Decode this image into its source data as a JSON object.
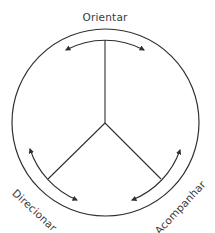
{
  "diagram": {
    "type": "circular-cycle",
    "labels": {
      "top": "Orientar",
      "bottom_left": "Direcionar",
      "bottom_right": "Acompanhar"
    },
    "colors": {
      "stroke": "#2f2f2f",
      "text": "#3a3a3a",
      "background": "#ffffff"
    },
    "sectors": 3,
    "arrows": [
      {
        "position": "top",
        "direction": "bidirectional"
      },
      {
        "position": "bottom-left",
        "direction": "bidirectional"
      },
      {
        "position": "bottom-right",
        "direction": "bidirectional"
      }
    ]
  }
}
